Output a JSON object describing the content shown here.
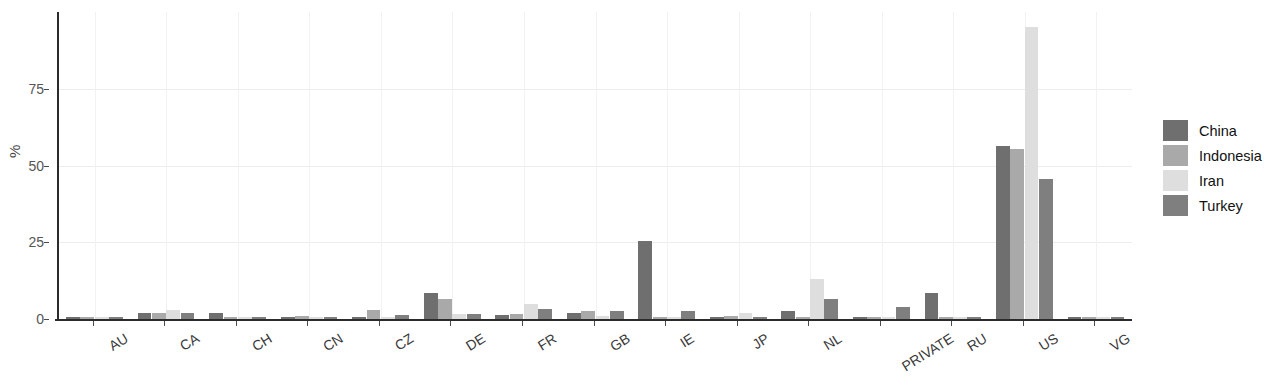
{
  "chart_data": {
    "type": "bar",
    "title": "",
    "subtitle": "",
    "xlabel": "",
    "ylabel": "%",
    "ylim": [
      0,
      100
    ],
    "yticks": [
      0,
      25,
      50,
      75
    ],
    "ytick_labels": [
      "0",
      "25",
      "50",
      "75"
    ],
    "grid": true,
    "grid_axis": "both",
    "legend_position": "right",
    "orientation": "vertical",
    "grouping": "grouped",
    "categories": [
      "AU",
      "CA",
      "CH",
      "CN",
      "CZ",
      "DE",
      "FR",
      "GB",
      "IE",
      "JP",
      "NL",
      "PRIVATE",
      "RU",
      "US",
      "VG"
    ],
    "series": [
      {
        "name": "China",
        "color": "#6f6f6f",
        "values": [
          0.6,
          1.9,
          1.8,
          0.8,
          0.2,
          8.5,
          1.2,
          1.9,
          25.5,
          0.3,
          2.5,
          0.2,
          8.5,
          56.5,
          0.2
        ]
      },
      {
        "name": "Indonesia",
        "color": "#a9a9a9",
        "values": [
          0.3,
          2.0,
          0.2,
          0.9,
          3.0,
          6.5,
          1.5,
          2.6,
          0.3,
          1.0,
          0.2,
          0.2,
          0.2,
          55.5,
          0.3
        ]
      },
      {
        "name": "Iran",
        "color": "#dedede",
        "values": [
          0.2,
          3.0,
          0.2,
          0.2,
          0.4,
          1.5,
          5.0,
          1.0,
          0.2,
          2.0,
          13.0,
          0.2,
          0.2,
          95.0,
          0.3
        ]
      },
      {
        "name": "Turkey",
        "color": "#7f7f7f",
        "values": [
          0.3,
          1.8,
          0.4,
          0.3,
          1.2,
          1.5,
          3.2,
          2.6,
          2.6,
          0.3,
          6.5,
          3.9,
          0.2,
          45.5,
          0.7
        ]
      }
    ]
  },
  "legend": {
    "items": [
      {
        "label": "China"
      },
      {
        "label": "Indonesia"
      },
      {
        "label": "Iran"
      },
      {
        "label": "Turkey"
      }
    ]
  },
  "axes": {
    "y_title": "%"
  }
}
